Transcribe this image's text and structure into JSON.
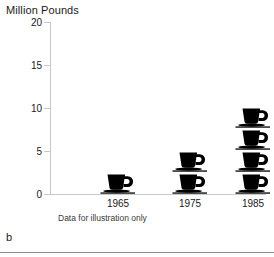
{
  "figure": {
    "letter": "b",
    "footnote": "Data for illustration only"
  },
  "chart_data": {
    "type": "bar",
    "variant": "pictogram",
    "title": "",
    "xlabel": "",
    "ylabel": "Million Pounds",
    "categories": [
      "1965",
      "1975",
      "1985"
    ],
    "values": [
      2.25,
      4.5,
      9.0
    ],
    "icon_counts": [
      1,
      2,
      4
    ],
    "icon": "coffee-cup-icon",
    "icon_unit_value": 2.25,
    "ylim": [
      0,
      20
    ],
    "yticks": [
      0,
      5,
      10,
      15,
      20
    ],
    "ytick_labels": [
      "0",
      "5",
      "10",
      "15",
      "20"
    ],
    "grid": false,
    "legend": false,
    "annotations": [
      "Data for illustration only"
    ],
    "colors": {
      "icon": "#000000",
      "axis": "#c8c8c8",
      "text": "#1a1a1a",
      "background": "#ffffff"
    }
  }
}
